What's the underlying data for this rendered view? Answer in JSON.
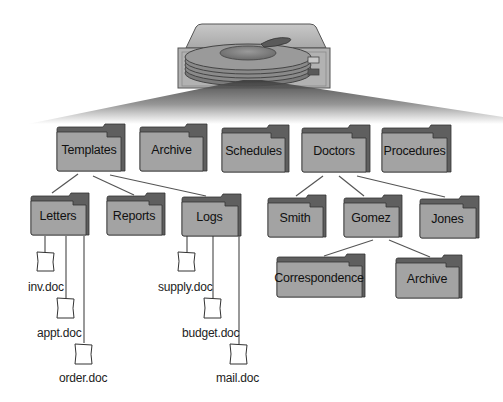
{
  "diagram": {
    "type": "directory-tree",
    "root": {
      "name": "hard-drive",
      "icon": "hard-drive-icon"
    },
    "colors": {
      "folder_fill": "#a3a3a3",
      "folder_back": "#6a6a6a",
      "folder_tab": "#5a5a5a",
      "folder_stroke": "#3a3a3a",
      "line": "#555555",
      "doc_fill": "#ffffff"
    },
    "top_level": [
      {
        "label": "Templates"
      },
      {
        "label": "Archive"
      },
      {
        "label": "Schedules"
      },
      {
        "label": "Doctors"
      },
      {
        "label": "Procedures"
      }
    ],
    "templates_children": [
      {
        "label": "Letters"
      },
      {
        "label": "Reports"
      },
      {
        "label": "Logs"
      }
    ],
    "doctors_children": [
      {
        "label": "Smith"
      },
      {
        "label": "Gomez"
      },
      {
        "label": "Jones"
      }
    ],
    "gomez_children": [
      {
        "label": "Correspondence"
      },
      {
        "label": "Archive"
      }
    ],
    "letters_files": [
      {
        "label": "inv.doc"
      },
      {
        "label": "appt.doc"
      },
      {
        "label": "order.doc"
      }
    ],
    "logs_files": [
      {
        "label": "supply.doc"
      },
      {
        "label": "budget.doc"
      },
      {
        "label": "mail.doc"
      }
    ]
  }
}
